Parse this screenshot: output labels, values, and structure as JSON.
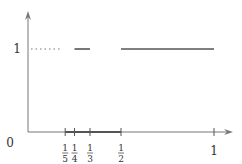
{
  "diagram": {
    "type": "step-function-plot",
    "origin_label": "0",
    "y_tick_label": "1",
    "x_ticks": [
      {
        "value": 0.2,
        "num": "1",
        "den": "5"
      },
      {
        "value": 0.25,
        "num": "1",
        "den": "4"
      },
      {
        "value": 0.3333,
        "num": "1",
        "den": "3"
      },
      {
        "value": 0.5,
        "num": "1",
        "den": "2"
      },
      {
        "value": 1.0,
        "label": "1"
      }
    ],
    "segments": [
      {
        "from": 0.25,
        "to": 0.3333,
        "y": 1,
        "style": "solid"
      },
      {
        "from": 0.5,
        "to": 1.0,
        "y": 1,
        "style": "solid"
      }
    ],
    "dotted_hint": {
      "from": 0,
      "to": 0.2,
      "y": 1
    },
    "highlighted_axis_interval": {
      "from": 0.2,
      "to": 0.5
    },
    "colors": {
      "axis": "#777777",
      "segment": "#555555",
      "text": "#333333"
    }
  }
}
